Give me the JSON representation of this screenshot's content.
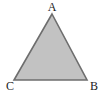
{
  "figure": {
    "name": "triangle-abc",
    "kind": "geometry-diagram",
    "canvas": {
      "width": 103,
      "height": 93,
      "background_color": "#ffffff"
    },
    "shape": {
      "type": "triangle",
      "fill_color": "#c2c2c2",
      "stroke_color": "#6e6e6e",
      "stroke_width": 1.6,
      "points": "52,14 87,80 14,80"
    },
    "vertices": [
      {
        "id": "vertex-a",
        "label": "A",
        "label_x": 52,
        "label_y": 11,
        "point_x": 52,
        "point_y": 14,
        "anchor": "middle"
      },
      {
        "id": "vertex-b",
        "label": "B",
        "label_x": 90,
        "label_y": 90,
        "point_x": 87,
        "point_y": 80,
        "anchor": "start"
      },
      {
        "id": "vertex-c",
        "label": "C",
        "label_x": 10,
        "label_y": 90,
        "point_x": 14,
        "point_y": 80,
        "anchor": "middle"
      }
    ]
  }
}
